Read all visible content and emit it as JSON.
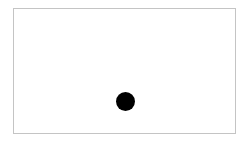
{
  "canvas": {
    "border_color": "#c4c4c4",
    "background": "#ffffff"
  },
  "dot": {
    "shape": "circle",
    "color": "#000000",
    "center_x": 125,
    "center_y": 101,
    "diameter": 19
  }
}
